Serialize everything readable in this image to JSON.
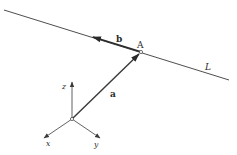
{
  "diagram": {
    "type": "vector-line-3d",
    "labels": {
      "line": "L",
      "point": "A",
      "direction_vector": "b",
      "position_vector": "a",
      "axis_x": "x",
      "axis_y": "y",
      "axis_z": "z"
    },
    "colors": {
      "stroke": "#3a3a3a",
      "text": "#2a2a2a",
      "background": "#ffffff"
    }
  }
}
